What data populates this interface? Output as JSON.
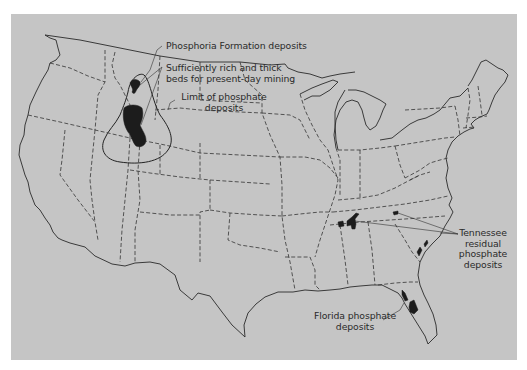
{
  "map": {
    "subject": "Phosphate deposits of the United States",
    "background_color": "#c5c5c5",
    "deposit_color": "#1c1c1c"
  },
  "labels": {
    "phosphoria": "Phosphoria Formation deposits",
    "rich_beds_line1": "Sufficiently rich and thick",
    "rich_beds_line2": "beds for present-day mining",
    "limit_line1": "Limit of phosphate",
    "limit_line2": "deposits",
    "tennessee_line1": "Tennessee",
    "tennessee_line2": "residual",
    "tennessee_line3": "phosphate",
    "tennessee_line4": "deposits",
    "florida_line1": "Florida phosphate",
    "florida_line2": "deposits"
  }
}
